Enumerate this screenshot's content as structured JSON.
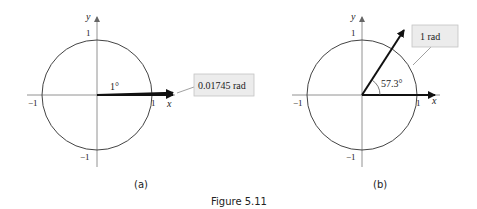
{
  "figure": {
    "caption": "Figure 5.11",
    "panels": [
      {
        "id": "a",
        "label": "(a)",
        "axis_x_label": "x",
        "axis_y_label": "y",
        "tick_pos_x": "1",
        "tick_neg_x": "−1",
        "tick_pos_y": "1",
        "tick_neg_y": "−1",
        "angle_label": "1°",
        "callout": "0.01745 rad"
      },
      {
        "id": "b",
        "label": "(b)",
        "axis_x_label": "x",
        "axis_y_label": "y",
        "tick_pos_x": "1",
        "tick_neg_x": "−1",
        "tick_pos_y": "1",
        "tick_neg_y": "−1",
        "angle_label": "57.3°",
        "callout": "1 rad"
      }
    ]
  },
  "colors": {
    "stroke": "#444444",
    "arrow": "#111111",
    "callout_bg": "#ececec",
    "callout_border": "#bbbbbb"
  }
}
